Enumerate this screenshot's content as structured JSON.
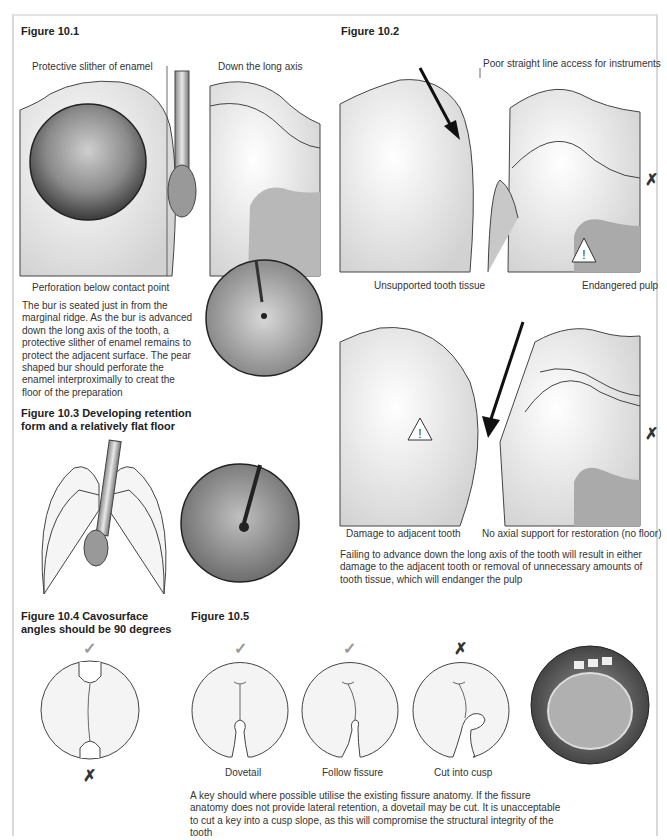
{
  "figures": {
    "fig_10_1": {
      "title": "Figure 10.1",
      "labels": {
        "protective_slither": "Protective slither of enamel",
        "long_axis": "Down the long axis",
        "perforation": "Perforation below contact point"
      },
      "caption": "The bur is seated just in from the marginal ridge. As the bur is advanced down the long axis of the tooth, a protective slither of enamel remains to protect the adjacent surface. The pear shaped bur should perforate the enamel interproximally to creat the floor of the preparation"
    },
    "fig_10_2": {
      "title": "Figure 10.2",
      "top_panel": {
        "labels": {
          "poor_access": "Poor straight line access for instruments",
          "unsupported": "Unsupported tooth tissue",
          "endangered_pulp": "Endangered pulp"
        },
        "mark": "✗"
      },
      "bottom_panel": {
        "labels": {
          "damage": "Damage to adjacent tooth",
          "no_axial": "No axial support for restoration (no floor)"
        },
        "mark": "✗"
      },
      "caption": "Failing to advance down the long axis of the tooth will result in either damage to the adjacent tooth or removal of unnecessary amounts of tooth tissue, which will endanger the pulp"
    },
    "fig_10_3": {
      "title": "Figure 10.3   Developing retention",
      "title_line2": "form and a relatively flat floor"
    },
    "fig_10_4": {
      "title": "Figure 10.4   Cavosurface",
      "title_line2": "angles should be 90 degrees",
      "top_mark": "✓",
      "bottom_mark": "✗"
    },
    "fig_10_5": {
      "title": "Figure 10.5",
      "items": [
        {
          "label": "Dovetail",
          "mark": "✓"
        },
        {
          "label": "Follow fissure",
          "mark": "✓"
        },
        {
          "label": "Cut into cusp",
          "mark": "✗"
        }
      ],
      "caption": "A key should where possible utilise the existing fissure anatomy. If the fissure anatomy does not provide lateral retention, a dovetail may be cut. It is unacceptable to cut a key into a cusp slope, as this will compromise the structural integrity of the tooth"
    }
  },
  "colors": {
    "check": "#9a9a9a",
    "cross": "#333333",
    "line": "#444444"
  }
}
